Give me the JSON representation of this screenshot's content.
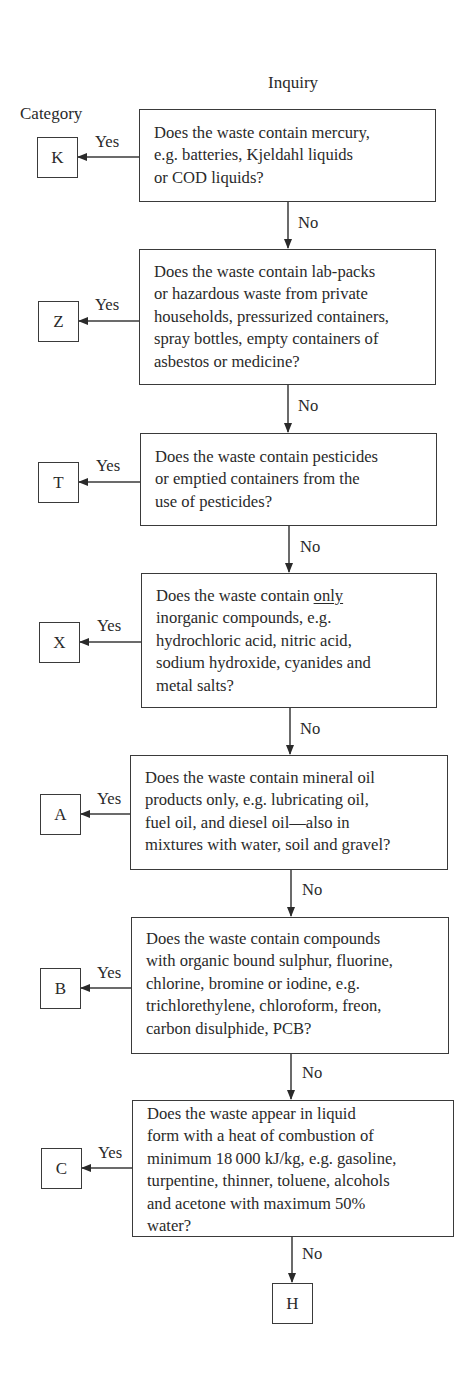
{
  "header": {
    "category_label": "Category",
    "inquiry_label": "Inquiry"
  },
  "edge_labels": {
    "yes": "Yes",
    "no": "No"
  },
  "steps": [
    {
      "category": "K",
      "question_lines": [
        "Does the waste contain mercury,",
        "e.g. batteries, Kjeldahl liquids",
        "or COD liquids?"
      ]
    },
    {
      "category": "Z",
      "question_lines": [
        "Does the waste contain lab-packs",
        "or hazardous waste from private",
        "households, pressurized containers,",
        "spray bottles, empty containers of",
        "asbestos or medicine?"
      ]
    },
    {
      "category": "T",
      "question_lines": [
        "Does the waste contain pesticides",
        "or emptied containers from the",
        "use of pesticides?"
      ]
    },
    {
      "category": "X",
      "question_lines": [
        "Does the waste contain only",
        "inorganic compounds, e.g.",
        "hydrochloric acid, nitric acid,",
        "sodium hydroxide, cyanides and",
        "metal salts?"
      ],
      "emphasis_word": "only"
    },
    {
      "category": "A",
      "question_lines": [
        "Does the waste contain mineral oil",
        "products only, e.g. lubricating oil,",
        "fuel oil, and diesel oil—also in",
        "mixtures with water, soil and gravel?"
      ]
    },
    {
      "category": "B",
      "question_lines": [
        "Does the waste contain compounds",
        "with organic bound sulphur, fluorine,",
        "chlorine, bromine or iodine, e.g.",
        "trichlorethylene, chloroform, freon,",
        "carbon disulphide, PCB?"
      ]
    },
    {
      "category": "C",
      "question_lines": [
        "Does the waste appear in liquid",
        "form with a heat of combustion of",
        "minimum 18 000 kJ/kg, e.g. gasoline,",
        "turpentine, thinner, toluene, alcohols",
        "and acetone with maximum 50%",
        "water?"
      ]
    }
  ],
  "final_category": "H"
}
